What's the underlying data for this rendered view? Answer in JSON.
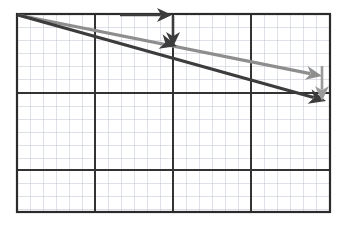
{
  "figure": {
    "background_color": "#ffffff"
  },
  "grid": {
    "label": "graph-paper-grid",
    "frame": {
      "x": 17,
      "y": 14,
      "width": 313,
      "height": 198
    },
    "border_color": "#2b2b2b",
    "border_width": 2.2,
    "major_color": "#333333",
    "major_width": 1.7,
    "minor_color": "#c3c9d4",
    "minor_width": 0.55,
    "minor_step": 13.05,
    "major_x": [
      17,
      95,
      173,
      251,
      330
    ],
    "major_y": [
      14,
      93,
      170,
      212
    ],
    "minor_x": [
      30,
      43,
      56,
      69,
      82,
      108,
      121,
      134,
      147,
      160,
      186,
      199,
      212,
      225,
      238,
      264,
      277,
      290,
      303,
      316
    ],
    "minor_y": [
      27,
      40,
      53,
      66,
      79,
      106,
      119,
      132,
      145,
      158,
      183,
      196,
      209
    ]
  },
  "vectors": {
    "dark": {
      "name": "dark-vector-arrow",
      "color": "#3c3c3c",
      "stroke_width": 3.2,
      "start": {
        "x": 18,
        "y": 15
      },
      "end": {
        "x": 326,
        "y": 101
      },
      "head_length": 17,
      "head_half_width": 7.5,
      "mid_head": {
        "x": 177,
        "y": 46,
        "present": true
      },
      "slope_description": "shallow downward slope crossing the center intersection"
    },
    "gray": {
      "name": "gray-vector-arrow",
      "color": "#8e8e8e",
      "stroke_width": 3.2,
      "start": {
        "x": 18,
        "y": 15
      },
      "end": {
        "x": 322,
        "y": 76
      },
      "head_length": 16,
      "head_half_width": 7,
      "slope_description": "shallower downward slope ending above the dark arrow"
    }
  },
  "annotations": [
    {
      "name": "horizontal-annotation-arrow",
      "color": "#3c3c3c",
      "stroke_width": 2.6,
      "start": {
        "x": 120,
        "y": 15
      },
      "end": {
        "x": 172,
        "y": 15
      },
      "direction": "right",
      "head_length": 15,
      "head_half_width": 7
    },
    {
      "name": "vertical-annotation-arrow-dark",
      "color": "#3c3c3c",
      "stroke_width": 2.6,
      "start": {
        "x": 173,
        "y": 16
      },
      "end": {
        "x": 173,
        "y": 47
      },
      "direction": "down",
      "head_length": 15,
      "head_half_width": 7
    },
    {
      "name": "vertical-annotation-arrow-gray",
      "color": "#9a9a9a",
      "stroke_width": 2.6,
      "start": {
        "x": 322,
        "y": 66
      },
      "end": {
        "x": 322,
        "y": 101
      },
      "direction": "down",
      "head_length": 15,
      "head_half_width": 7
    }
  ],
  "chart_data": {
    "type": "line",
    "xlabel": "",
    "ylabel": "",
    "grid": true,
    "legend": "none",
    "xlim": [
      0,
      24
    ],
    "ylim": [
      0,
      15.2
    ],
    "note": "Coordinates expressed in minor grid squares; origin at the lower-left corner of the frame, y increasing upward.",
    "series": [
      {
        "name": "dark-vector",
        "color": "#3c3c3c",
        "x": [
          0,
          12.3,
          23.6
        ],
        "y": [
          15.2,
          12.8,
          8.6
        ]
      },
      {
        "name": "gray-vector",
        "color": "#8e8e8e",
        "x": [
          0,
          23.3
        ],
        "y": [
          15.2,
          10.5
        ]
      }
    ],
    "annotations": [
      {
        "text": "",
        "type": "arrow",
        "from": [
          7.9,
          15.2
        ],
        "to": [
          11.9,
          15.2
        ]
      },
      {
        "text": "",
        "type": "arrow",
        "from": [
          12.0,
          15.1
        ],
        "to": [
          12.0,
          12.7
        ]
      },
      {
        "text": "",
        "type": "arrow",
        "from": [
          23.4,
          11.2
        ],
        "to": [
          23.4,
          8.5
        ]
      }
    ]
  }
}
